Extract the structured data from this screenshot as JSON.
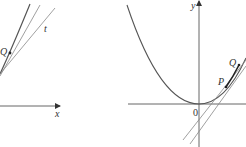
{
  "figure": {
    "left_panel": {
      "labels": {
        "point_q": "Q",
        "tangent": "t",
        "x_axis": "x"
      }
    },
    "right_panel": {
      "labels": {
        "y_axis": "y",
        "origin": "0",
        "point_p": "P",
        "point_q": "Q"
      }
    },
    "colors": {
      "line": "#7a7a7a",
      "curve": "#555555",
      "axis": "#666666",
      "text": "#333333"
    }
  }
}
